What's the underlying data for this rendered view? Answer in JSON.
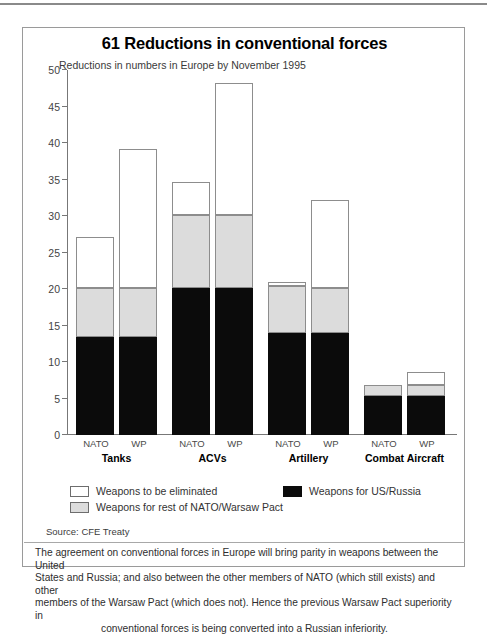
{
  "panel": {
    "title": "61 Reductions in conventional forces",
    "subtitle": "Reductions in numbers in Europe by November 1995",
    "source": "Source: CFE Treaty",
    "caption_line1": "The agreement on conventional forces in Europe will bring parity in weapons between the United",
    "caption_line2": "States and Russia; and also between the other members of NATO (which still exists) and other",
    "caption_line3": "members of the Warsaw Pact (which does not). Hence the previous Warsaw Pact superiority in",
    "caption_line4": "conventional forces is being converted into a Russian inferiority."
  },
  "legend": {
    "items": [
      {
        "label": "Weapons to be eliminated",
        "color": "#ffffff",
        "swatch": "sw-white"
      },
      {
        "label": "Weapons for US/Russia",
        "color": "#0b0b0b",
        "swatch": "sw-black"
      },
      {
        "label": "Weapons for rest of NATO/Warsaw Pact",
        "color": "#dcdcdc",
        "swatch": "sw-gray"
      }
    ]
  },
  "axis": {
    "ticks": [
      "0",
      "5",
      "10",
      "15",
      "20",
      "25",
      "30",
      "35",
      "40",
      "45",
      "50"
    ]
  },
  "bar_labels": {
    "nato": "NATO",
    "wp": "WP"
  },
  "groups": [
    {
      "name": "Tanks"
    },
    {
      "name": "ACVs"
    },
    {
      "name": "Artillery"
    },
    {
      "name": "Combat Aircraft"
    }
  ],
  "chart_data": {
    "type": "bar",
    "subtype": "stacked-grouped-column",
    "title": "61 Reductions in conventional forces",
    "subtitle": "Reductions in numbers in Europe by November 1995",
    "xlabel": "",
    "ylabel": "",
    "ylim": [
      0,
      50
    ],
    "yticks": [
      0,
      5,
      10,
      15,
      20,
      25,
      30,
      35,
      40,
      45,
      50
    ],
    "grid": false,
    "legend_position": "below-plot",
    "categories": [
      "Tanks NATO",
      "Tanks WP",
      "ACVs NATO",
      "ACVs WP",
      "Artillery NATO",
      "Artillery WP",
      "Combat Aircraft NATO",
      "Combat Aircraft WP"
    ],
    "groups": [
      "Tanks",
      "ACVs",
      "Artillery",
      "Combat Aircraft"
    ],
    "subcategories": [
      "NATO",
      "WP"
    ],
    "series": [
      {
        "name": "Weapons for US/Russia",
        "color": "#0b0b0b",
        "values": [
          13.4,
          13.4,
          20.2,
          20.2,
          14.0,
          14.0,
          5.4,
          5.4
        ]
      },
      {
        "name": "Weapons for rest of NATO/Warsaw Pact",
        "color": "#dcdcdc",
        "values": [
          6.8,
          6.8,
          10.0,
          10.0,
          6.4,
          6.2,
          1.4,
          1.4
        ]
      },
      {
        "name": "Weapons to be eliminated",
        "color": "#ffffff",
        "values": [
          6.9,
          19.0,
          4.5,
          18.0,
          0.6,
          12.0,
          0.0,
          1.9
        ]
      }
    ],
    "totals": [
      27.1,
      39.2,
      34.7,
      48.4,
      21.0,
      32.2,
      6.8,
      8.7
    ],
    "source": "Source: CFE Treaty"
  }
}
